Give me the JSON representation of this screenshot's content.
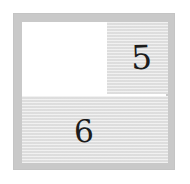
{
  "board": {
    "title": "grid-board",
    "frame_color": "#c9c9c9",
    "cell_fill_color": "#e0e0e0",
    "empty_cell_color": "#ffffff",
    "label_color": "#1c1c1c",
    "rows": 2,
    "columns": 2,
    "cells": [
      {
        "id": "top-left",
        "label": "",
        "filled": false,
        "row": 1,
        "column": 1,
        "col_span": 1
      },
      {
        "id": "top-right",
        "label": "5",
        "filled": true,
        "row": 1,
        "column": 2,
        "col_span": 1
      },
      {
        "id": "bottom",
        "label": "6",
        "filled": true,
        "row": 2,
        "column": 1,
        "col_span": 2
      }
    ]
  }
}
